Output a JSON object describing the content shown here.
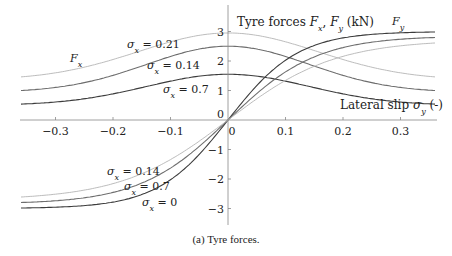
{
  "caption": "(a) Tyre forces.",
  "chart_data": {
    "type": "line",
    "title": "Tyre forces Fx, Fy (kN)",
    "xlabel": "Lateral slip σy (-)",
    "ylabel": "Tyre forces Fx, Fy (kN)",
    "xlim": [
      -0.36,
      0.36
    ],
    "ylim": [
      -3.5,
      3.5
    ],
    "grid": false,
    "legend": "inline annotations",
    "x_ticks": [
      -0.3,
      -0.2,
      -0.1,
      0,
      0.1,
      0.2,
      0.3
    ],
    "x_tick_labels": [
      "−0.3",
      "−0.2",
      "−0.1",
      "0",
      "0.1",
      "0.2",
      "0.3"
    ],
    "y_ticks": [
      -3,
      -2,
      -1,
      0,
      1,
      2,
      3
    ],
    "y_tick_labels": [
      "−3",
      "−2",
      "−1",
      "0",
      "1",
      "2",
      "3"
    ],
    "x": [
      -0.36,
      -0.3,
      -0.2,
      -0.1,
      -0.05,
      0,
      0.05,
      0.1,
      0.2,
      0.3,
      0.36
    ],
    "series": [
      {
        "name": "Fx, σx = 0.21",
        "group": "Fx",
        "shade": "light",
        "values": [
          1.46,
          1.65,
          2.12,
          2.68,
          2.88,
          2.95,
          2.88,
          2.68,
          2.12,
          1.65,
          1.46
        ]
      },
      {
        "name": "Fx, σx = 0.14",
        "group": "Fx",
        "shade": "mid",
        "values": [
          1.0,
          1.18,
          1.7,
          2.25,
          2.44,
          2.5,
          2.44,
          2.25,
          1.7,
          1.18,
          1.0
        ]
      },
      {
        "name": "Fx, σx = 0.7",
        "group": "Fx",
        "shade": "dark",
        "values": [
          0.54,
          0.64,
          0.92,
          1.32,
          1.5,
          1.55,
          1.5,
          1.32,
          0.92,
          0.64,
          0.54
        ]
      },
      {
        "name": "Fy, σx = 0",
        "group": "Fy",
        "shade": "dark",
        "values": [
          -3.0,
          -2.99,
          -2.88,
          -2.05,
          -1.2,
          0,
          1.2,
          2.05,
          2.88,
          2.99,
          3.0
        ]
      },
      {
        "name": "Fy, σx = 0.7",
        "group": "Fy",
        "shade": "mid",
        "values": [
          -2.8,
          -2.72,
          -2.38,
          -1.55,
          -0.85,
          0,
          0.85,
          1.55,
          2.38,
          2.72,
          2.8
        ]
      },
      {
        "name": "Fy, σx = 0.14",
        "group": "Fy",
        "shade": "light",
        "values": [
          -2.6,
          -2.5,
          -2.1,
          -1.3,
          -0.7,
          0,
          0.7,
          1.3,
          2.1,
          2.5,
          2.6
        ]
      }
    ],
    "annotations": [
      {
        "text": "Fx",
        "x": -0.3,
        "y": 2.0
      },
      {
        "text": "σx = 0.21",
        "x": -0.13,
        "y": 2.35
      },
      {
        "text": "σx = 0.14",
        "x": -0.09,
        "y": 1.75
      },
      {
        "text": "σx = 0.7",
        "x": -0.07,
        "y": 0.85
      },
      {
        "text": "Fy",
        "x": 0.27,
        "y": 3.2
      },
      {
        "text": "σx = 0.14",
        "x": -0.2,
        "y": -1.7
      },
      {
        "text": "σx = 0.7",
        "x": -0.17,
        "y": -2.2
      },
      {
        "text": "σx = 0",
        "x": -0.11,
        "y": -2.65
      }
    ],
    "colors": {
      "light": "#b4b4b4",
      "mid": "#6e6e6e",
      "dark": "#3c3c3c",
      "axis": "#888888"
    }
  },
  "labels": {
    "y_axis_title_prefix": "Tyre forces ",
    "y_axis_title_fx": "F",
    "y_axis_title_fx_sub": "x",
    "y_axis_title_sep": ", ",
    "y_axis_title_fy": "F",
    "y_axis_title_fy_sub": "y",
    "y_axis_title_unit": " (kN)",
    "x_axis_title_prefix": "Lateral slip ",
    "x_axis_title_sym": "σ",
    "x_axis_title_sub": "y",
    "x_axis_title_unit": " (-)",
    "fx_label": "F",
    "fx_label_sub": "x",
    "fy_label": "F",
    "fy_label_sub": "y",
    "sigma": "σ",
    "sigma_sub": "x",
    "eq_021": " = 0.21",
    "eq_014": " = 0.14",
    "eq_07": " = 0.7",
    "eq_0": " = 0"
  }
}
